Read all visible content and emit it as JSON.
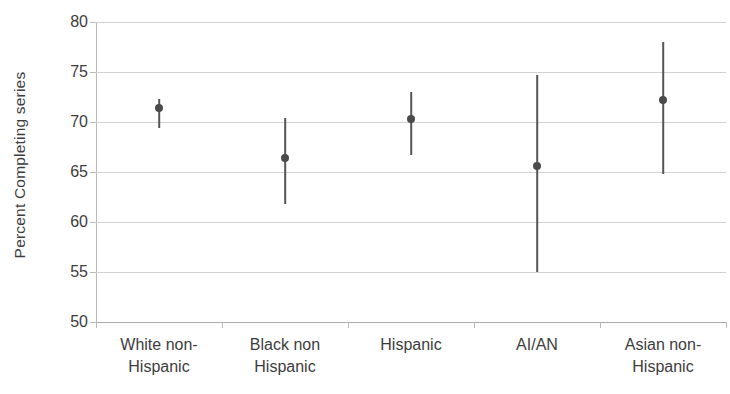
{
  "chart_data": {
    "type": "scatter",
    "title": "",
    "xlabel": "",
    "ylabel": "Percent Completing series",
    "ylim": [
      50,
      80
    ],
    "yticks": [
      50,
      55,
      60,
      65,
      70,
      75,
      80
    ],
    "ytick_labels": [
      "50",
      "55",
      "60",
      "65",
      "70",
      "75",
      "80"
    ],
    "grid": true,
    "legend": "none",
    "error_bars": "vertical",
    "marker_color": "#4a4a4a",
    "errorbar_color": "#555555",
    "gridline_color": "#d2d2d2",
    "categories": [
      "White non-Hispanic",
      "Black non Hispanic",
      "Hispanic",
      "AI/AN",
      "Asian non-Hispanic"
    ],
    "category_lines": [
      [
        "White non-",
        "Hispanic"
      ],
      [
        "Black non",
        "Hispanic"
      ],
      [
        "Hispanic",
        ""
      ],
      [
        "AI/AN",
        ""
      ],
      [
        "Asian non-",
        "Hispanic"
      ]
    ],
    "values": [
      71.4,
      66.4,
      70.3,
      65.6,
      72.2
    ],
    "ci_lower": [
      69.4,
      61.8,
      66.7,
      55.0,
      64.8
    ],
    "ci_upper": [
      72.3,
      70.4,
      73.0,
      74.7,
      78.0
    ],
    "points": [
      {
        "category": "White non-Hispanic",
        "value": 71.4,
        "low": 69.4,
        "high": 72.3
      },
      {
        "category": "Black non Hispanic",
        "value": 66.4,
        "low": 61.8,
        "high": 70.4
      },
      {
        "category": "Hispanic",
        "value": 70.3,
        "low": 66.7,
        "high": 73.0
      },
      {
        "category": "AI/AN",
        "value": 65.6,
        "low": 55.0,
        "high": 74.7
      },
      {
        "category": "Asian non-Hispanic",
        "value": 72.2,
        "low": 64.8,
        "high": 78.0
      }
    ]
  }
}
